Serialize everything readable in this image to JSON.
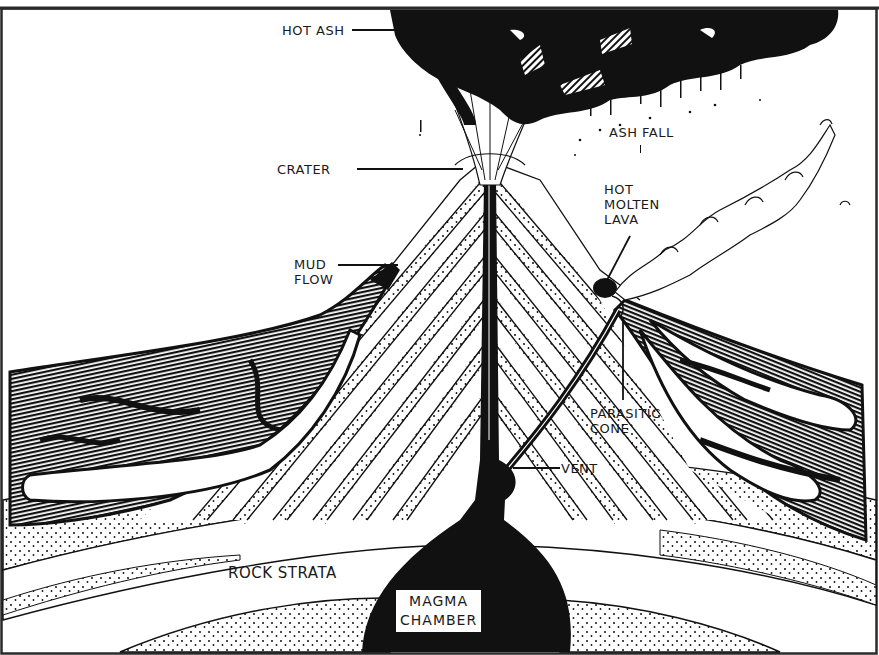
{
  "diagram": {
    "colors": {
      "ink": "#111111",
      "paper": "#ffffff",
      "frame": "#2a2a2a"
    },
    "labels": [
      {
        "id": "hot-ash",
        "text": "HOT ASH"
      },
      {
        "id": "crater",
        "text": "CRATER"
      },
      {
        "id": "ash-fall",
        "text": "ASH FALL"
      },
      {
        "id": "hot-molten-lava",
        "text": "HOT\nMOLTEN\nLAVA"
      },
      {
        "id": "mud-flow",
        "text": "MUD\nFLOW"
      },
      {
        "id": "parasitic-cone",
        "text": "PARASITIC\nCONE"
      },
      {
        "id": "vent",
        "text": "VENT"
      },
      {
        "id": "rock-strata",
        "text": "ROCK STRATA"
      },
      {
        "id": "magma-chamber",
        "text": "MAGMA\nCHAMBER"
      }
    ]
  }
}
